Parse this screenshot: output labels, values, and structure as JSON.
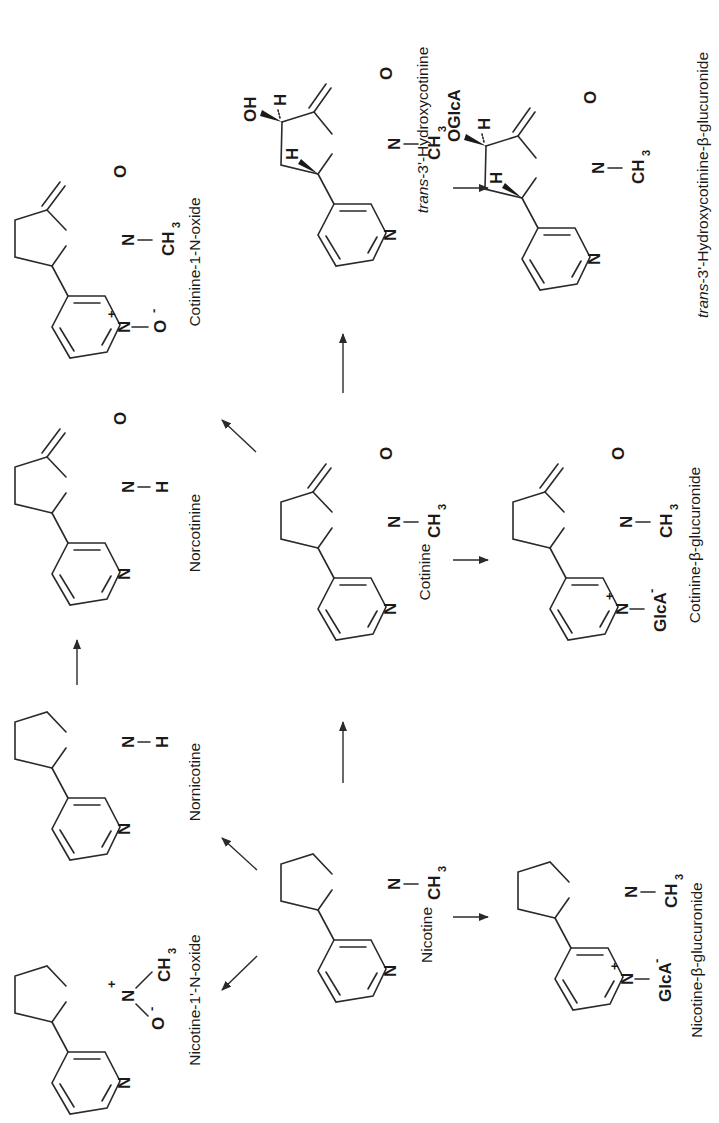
{
  "diagram": {
    "orientation": "rotated -90deg",
    "compounds": [
      {
        "id": "nicotine",
        "label": "Nicotine"
      },
      {
        "id": "nornicotine",
        "label": "Nornicotine"
      },
      {
        "id": "nicotine_n_oxide",
        "label": "Nicotine-1'-N-oxide"
      },
      {
        "id": "nicotine_glucuronide",
        "label": "Nicotine-β-glucuronide"
      },
      {
        "id": "cotinine",
        "label": "Cotinine"
      },
      {
        "id": "norcotinine",
        "label": "Norcotinine"
      },
      {
        "id": "cotinine_n_oxide",
        "label": "Cotinine-1-N-oxide"
      },
      {
        "id": "cotinine_glucuronide",
        "label": "Cotinine-β-glucuronide"
      },
      {
        "id": "hydroxycotinine",
        "label_italic": "trans",
        "label_rest": "-3'-Hydroxycotinine"
      },
      {
        "id": "hydroxycotinine_glucuronide",
        "label_italic": "trans",
        "label_rest": "-3'-Hydroxycotinine-β-glucuronide"
      }
    ],
    "atoms": {
      "N": "N",
      "O": "O",
      "H": "H",
      "OH": "OH",
      "OGlcA": "OGlcA",
      "CH": "CH",
      "sub3": "3",
      "GlcA": "GlcA",
      "plus": "+",
      "minus": "-",
      "Ominus": "O"
    },
    "arrows": [
      {
        "from": "nicotine",
        "to": "nornicotine"
      },
      {
        "from": "nicotine",
        "to": "nicotine_n_oxide"
      },
      {
        "from": "nicotine",
        "to": "nicotine_glucuronide"
      },
      {
        "from": "nicotine",
        "to": "cotinine"
      },
      {
        "from": "nornicotine",
        "to": "norcotinine"
      },
      {
        "from": "cotinine",
        "to": "norcotinine"
      },
      {
        "from": "cotinine",
        "to": "cotinine_glucuronide"
      },
      {
        "from": "cotinine",
        "to": "hydroxycotinine"
      },
      {
        "from": "hydroxycotinine",
        "to": "hydroxycotinine_glucuronide"
      }
    ]
  }
}
